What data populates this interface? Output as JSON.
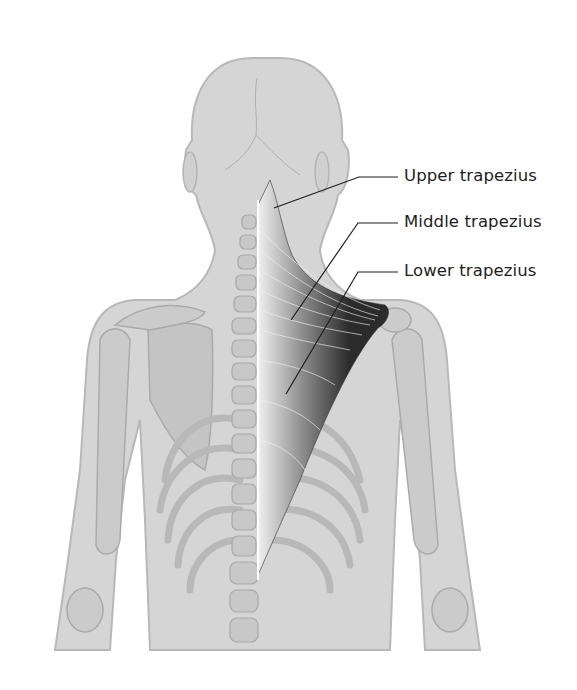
{
  "figure": {
    "labels": [
      {
        "id": "upper",
        "text": "Upper trapezius"
      },
      {
        "id": "middle",
        "text": "Middle trapezius"
      },
      {
        "id": "lower",
        "text": "Lower trapezius"
      }
    ],
    "colors": {
      "body": "#d3d3d3",
      "body_outline": "#b4b4b4",
      "bone": "#c6c6c6",
      "bone_outline": "#aaaaaa",
      "muscle_dark": "#2b2b2b",
      "muscle_light": "#e8e8e8",
      "leader": "#1e1e1e",
      "text": "#1e1e1e"
    }
  }
}
